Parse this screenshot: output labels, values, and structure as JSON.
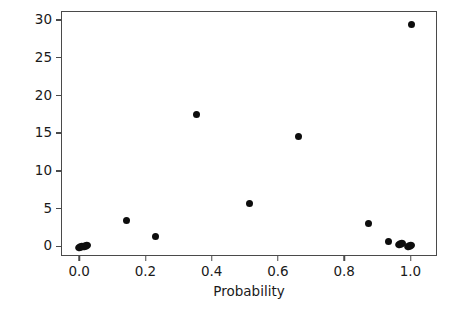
{
  "chart_data": {
    "type": "scatter",
    "title": "",
    "xlabel": "Probability",
    "ylabel": "Delta Chi-Square",
    "xlim": [
      -0.055,
      1.08
    ],
    "ylim": [
      -1.3,
      31.2
    ],
    "xticks": [
      "0.0",
      "0.2",
      "0.4",
      "0.6",
      "0.8",
      "1.0"
    ],
    "xtick_values": [
      0.0,
      0.2,
      0.4,
      0.6,
      0.8,
      1.0
    ],
    "yticks": [
      "0",
      "5",
      "10",
      "15",
      "20",
      "25",
      "30"
    ],
    "ytick_values": [
      0,
      5,
      10,
      15,
      20,
      25,
      30
    ],
    "grid": false,
    "legend": null,
    "marker": "filled-circle",
    "marker_color": "#0d0d0d",
    "frame_color": "#4a4a4a",
    "background_color": "#ffffff",
    "points": [
      {
        "x": 0.002,
        "y": 0.1,
        "shape": "wide"
      },
      {
        "x": 0.016,
        "y": 0.22,
        "shape": "wide"
      },
      {
        "x": 0.14,
        "y": 3.6,
        "shape": "round"
      },
      {
        "x": 0.228,
        "y": 1.4,
        "shape": "round"
      },
      {
        "x": 0.352,
        "y": 17.6,
        "shape": "round"
      },
      {
        "x": 0.512,
        "y": 5.8,
        "shape": "round"
      },
      {
        "x": 0.658,
        "y": 14.7,
        "shape": "round"
      },
      {
        "x": 0.87,
        "y": 3.1,
        "shape": "round"
      },
      {
        "x": 0.932,
        "y": 0.75,
        "shape": "round"
      },
      {
        "x": 0.968,
        "y": 0.4,
        "shape": "wide"
      },
      {
        "x": 0.994,
        "y": 0.15,
        "shape": "wide"
      },
      {
        "x": 1.0,
        "y": 29.6,
        "shape": "round"
      }
    ]
  }
}
